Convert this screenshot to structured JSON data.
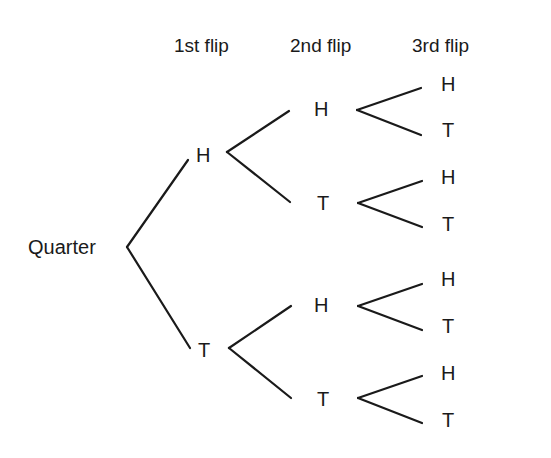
{
  "headers": {
    "first": "1st flip",
    "second": "2nd flip",
    "third": "3rd flip"
  },
  "root": "Quarter",
  "level1": [
    {
      "label": "H"
    },
    {
      "label": "T"
    }
  ],
  "level2": [
    {
      "label": "H"
    },
    {
      "label": "T"
    },
    {
      "label": "H"
    },
    {
      "label": "T"
    }
  ],
  "level3": [
    {
      "label": "H"
    },
    {
      "label": "T"
    },
    {
      "label": "H"
    },
    {
      "label": "T"
    },
    {
      "label": "H"
    },
    {
      "label": "T"
    },
    {
      "label": "H"
    },
    {
      "label": "T"
    }
  ],
  "colors": {
    "ink": "#1a1a1a",
    "background": "#ffffff"
  }
}
